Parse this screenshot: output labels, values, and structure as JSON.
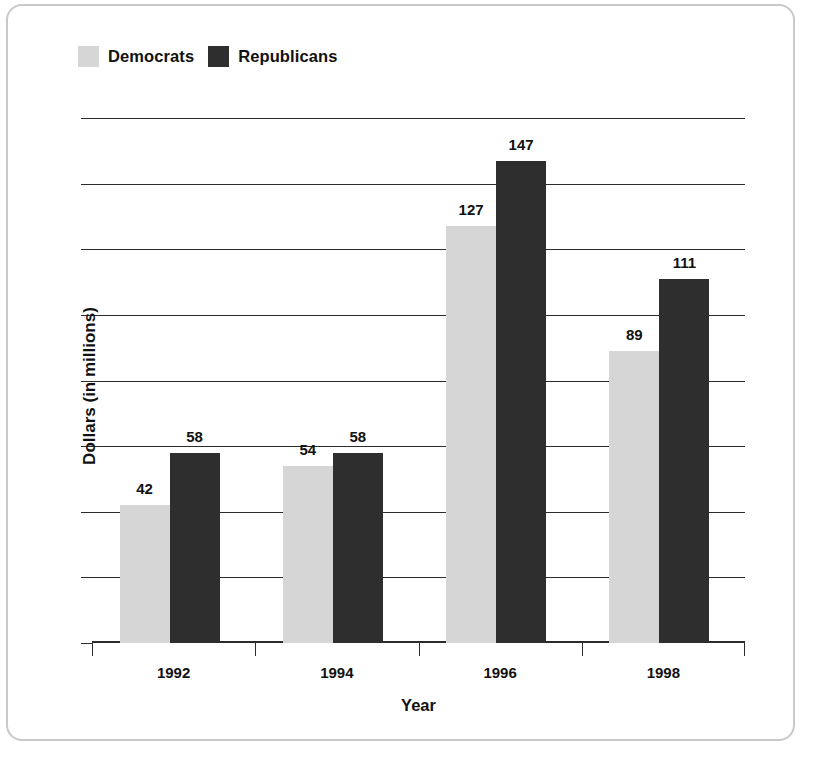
{
  "chart_data": {
    "type": "bar",
    "title": "",
    "categories": [
      "1992",
      "1994",
      "1996",
      "1998"
    ],
    "series": [
      {
        "name": "Democrats",
        "color": "#d6d6d6",
        "values": [
          42,
          54,
          127,
          89
        ]
      },
      {
        "name": "Republicans",
        "color": "#2e2e2e",
        "values": [
          58,
          58,
          147,
          111
        ]
      }
    ],
    "xlabel": "Year",
    "ylabel": "Dollars (in millions)",
    "ylim": [
      0,
      160
    ],
    "yticks": [
      0,
      20,
      40,
      60,
      80,
      100,
      120,
      140,
      160
    ],
    "ytick_labels": [
      "0",
      "20",
      "40",
      "60",
      "80",
      "100",
      "120",
      "140",
      "160"
    ],
    "grid": true,
    "legend_position": "top-left",
    "value_labels": true
  },
  "legend": {
    "entries": [
      {
        "label": "Democrats",
        "swatch_color": "#d6d6d6"
      },
      {
        "label": "Republicans",
        "swatch_color": "#2e2e2e"
      }
    ]
  },
  "axes": {
    "y_title": "Dollars (in millions)",
    "x_title": "Year"
  },
  "colors": {
    "democrats": "#d6d6d6",
    "republicans": "#2e2e2e",
    "axis": "#2b2b2b",
    "text": "#111111",
    "page_border": "#c9c9c9"
  }
}
